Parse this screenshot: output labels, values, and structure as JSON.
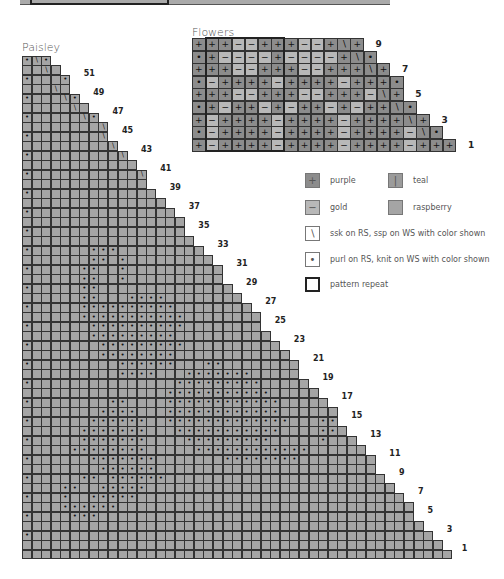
{
  "colors": {
    "purple": "#8c8c8c",
    "gold": "#b8b8b8",
    "raspberry": "#a5a5a5",
    "teal": "#9b9b9b",
    "grid_line": "#333333",
    "blank": "#ffffff"
  },
  "symbols": {
    "purple": "+",
    "gold": "−",
    "teal": "|",
    "ssk": "∖",
    "purl": "•"
  },
  "flowers": {
    "title": "Flowers",
    "row_numbers": [
      "9",
      "7",
      "5",
      "3",
      "1"
    ],
    "rows": [
      {
        "n": 9,
        "cells": "P+,P+,P+,G-,G-,P+,P+,P+,G-,G-,P+,Ps,P+"
      },
      {
        "n": 8,
        "cells": "Po,P+,G-,G-,G-,G-,P+,G-,G-,G-,G-,P+,Ps,Po"
      },
      {
        "n": 7,
        "cells": "P+,P+,P+,G-,G-,P+,P+,P+,G-,G-,P+,P+,P+,Ps,P+"
      },
      {
        "n": 6,
        "cells": "Po,G-,P+,P+,P+,P+,G-,P+,P+,P+,P+,G-,P+,P+,P+,Po"
      },
      {
        "n": 5,
        "cells": "P+,P+,P+,G-,G-,P+,P+,P+,G-,G-,P+,P+,P+,G-,Ps,P+"
      },
      {
        "n": 4,
        "cells": "Po,P+,G-,P+,P+,G-,P+,G-,P+,P+,G-,P+,G-,P+,P+,Ps,Po"
      },
      {
        "n": 3,
        "cells": "P+,G-,P+,P+,P+,P+,G-,P+,P+,P+,P+,G-,P+,P+,P+,P+,Ps,P+"
      },
      {
        "n": 2,
        "cells": "Po,G-,P+,P+,P+,P+,G-,P+,P+,P+,P+,G-,P+,P+,P+,P+,G-,Ps,Po"
      },
      {
        "n": 1,
        "cells": "P+,G-,P+,P+,P+,P+,G-,P+,P+,P+,P+,G-,P+,P+,P+,P+,G-,P+,P+,P+"
      }
    ],
    "repeat": {
      "col_start": 1,
      "col_end": 6
    }
  },
  "paisley": {
    "title": "Paisley",
    "row_numbers": [
      "51",
      "49",
      "47",
      "45",
      "43",
      "41",
      "39",
      "37",
      "35",
      "33",
      "31",
      "29",
      "27",
      "25",
      "23",
      "21",
      "19",
      "17",
      "15",
      "13",
      "11",
      "9",
      "7",
      "5",
      "3",
      "1"
    ],
    "rows": [
      "o\\o",
      "..\\.",
      "o...o",
      "...\\.",
      "o...\\o",
      ".....\\.",
      "o.....\\o",
      "........\\",
      "o.......\\o",
      ".........\\.",
      "o.........\\o",
      "............\\",
      "o...........\\o",
      ".............\\.",
      "o.............\\o",
      "................\\",
      "o...............\\o",
      "..................\\",
      "o.................\\o",
      "...................\\.",
      "o......ooo...........\\o",
      ".......oo.o............\\",
      "o.....oo..o.............\\o",
      "......oo..o...............\\",
      "o.....oo..................\\o",
      "......oo...oooo.............\\",
      "o.....oooooooooo.............\\o",
      "......ooooooooooo..............\\",
      "o......oooooooooo...............\\o",
      ".......ooooooooo.................\\",
      "o.......ooooooooo.................\\o",
      "........oooooooo...................\\",
      "o.........oooooo...oo...............\\o",
      "..........oooo...ooooooo.............\\",
      "o...............ooooooooo.............\\o",
      "...............ooooooooooo..............\\",
      "o........oo....oooooooooooo..............\\o",
      "........oooo...oooooooooooo...............\\",
      "o......oooooo..ooooooooooooo...oo...........\\o",
      "......ooooooo...ooooooooooo....oo............\\",
      "o.....ooooooo....ooooooooo.....o..............\\o",
      ".....oooooooo.....oooooooooooo...................\\",
      "o......ooooooo.......oooooooo.....................\\o",
      "........oooooo........................................\\",
      "o.....oo.oooooo........................................\\o",
      "....oo..ooooo............................................\\",
      "o...o..ooooo..............................................\\o",
      "....oooooo.................................................\\",
      "o....ooo....................................................\\o",
      "..............................................................\\",
      "o..............................................................\\o",
      "................................................................\\",
      "...................................................................."
    ]
  },
  "legend": {
    "items": [
      {
        "key": "purple",
        "symbol": "+",
        "label": "purple"
      },
      {
        "key": "teal",
        "symbol": "|",
        "label": "teal"
      },
      {
        "key": "gold",
        "symbol": "−",
        "label": "gold"
      },
      {
        "key": "raspberry",
        "symbol": "",
        "label": "raspberry"
      },
      {
        "key": "ssk",
        "symbol": "∖",
        "label": "ssk on RS, ssp on WS with color shown"
      },
      {
        "key": "purl",
        "symbol": "•",
        "label": "purl on RS, knit on WS with color shown"
      },
      {
        "key": "repeat",
        "symbol": "",
        "label": "pattern repeat"
      }
    ]
  }
}
